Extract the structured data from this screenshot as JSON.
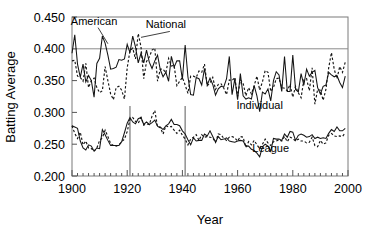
{
  "chart_data": {
    "type": "line",
    "title": "",
    "xlabel": "Year",
    "ylabel": "Batting Average",
    "xlim": [
      1900,
      2000
    ],
    "ylim": [
      0.2,
      0.45
    ],
    "grid": false,
    "legend_position": "inline-annotations",
    "xticks": [
      1900,
      1920,
      1940,
      1960,
      1980,
      2000
    ],
    "xtick_labels": [
      "1900",
      "1920",
      "1940",
      "1960",
      "1980",
      "2000"
    ],
    "yticks": [
      0.2,
      0.25,
      0.3,
      0.35,
      0.4,
      0.45
    ],
    "ytick_labels": [
      "0.200",
      "0.250",
      "0.300",
      "0.350",
      "0.400",
      "0.450"
    ],
    "minor_xtick_interval": 2,
    "annotations": [
      {
        "text": "American",
        "x": 1908,
        "y": 0.438,
        "points_to_x": 1913,
        "points_to_y": 0.408
      },
      {
        "text": "National",
        "x": 1934,
        "y": 0.432,
        "points_to_x": 1925,
        "points_to_y": 0.418
      },
      {
        "text": "Individual",
        "x": 1968,
        "y": 0.306,
        "points_to_x": null,
        "points_to_y": null
      },
      {
        "text": "League",
        "x": 1972,
        "y": 0.238,
        "points_to_x": null,
        "points_to_y": null
      }
    ],
    "reference_lines": [
      {
        "orientation": "horizontal",
        "value": 0.4,
        "label": ".400 mark"
      },
      {
        "orientation": "vertical",
        "value": 1921,
        "label": "live-ball era start"
      },
      {
        "orientation": "vertical",
        "value": 1941,
        "label": "last .400 season"
      }
    ],
    "series": [
      {
        "name": "American League Individual Batting Champion",
        "group": "Individual",
        "style": "solid",
        "x": [
          1900,
          1901,
          1902,
          1903,
          1904,
          1905,
          1906,
          1907,
          1908,
          1909,
          1910,
          1911,
          1912,
          1913,
          1914,
          1915,
          1916,
          1917,
          1918,
          1919,
          1920,
          1921,
          1922,
          1923,
          1924,
          1925,
          1926,
          1927,
          1928,
          1929,
          1930,
          1931,
          1932,
          1933,
          1934,
          1935,
          1936,
          1937,
          1938,
          1939,
          1940,
          1941,
          1942,
          1943,
          1944,
          1945,
          1946,
          1947,
          1948,
          1949,
          1950,
          1951,
          1952,
          1953,
          1954,
          1955,
          1956,
          1957,
          1958,
          1959,
          1960,
          1961,
          1962,
          1963,
          1964,
          1965,
          1966,
          1967,
          1968,
          1969,
          1970,
          1971,
          1972,
          1973,
          1974,
          1975,
          1976,
          1977,
          1978,
          1979,
          1980,
          1981,
          1982,
          1983,
          1984,
          1985,
          1986,
          1987,
          1988,
          1989,
          1990,
          1991,
          1992,
          1993,
          1994,
          1995,
          1996,
          1997,
          1998,
          1999
        ],
        "y": [
          0.393,
          0.422,
          0.376,
          0.355,
          0.376,
          0.348,
          0.358,
          0.35,
          0.324,
          0.377,
          0.385,
          0.42,
          0.409,
          0.39,
          0.368,
          0.369,
          0.371,
          0.383,
          0.382,
          0.384,
          0.407,
          0.394,
          0.42,
          0.403,
          0.378,
          0.393,
          0.378,
          0.398,
          0.379,
          0.369,
          0.381,
          0.39,
          0.367,
          0.356,
          0.363,
          0.349,
          0.388,
          0.371,
          0.381,
          0.381,
          0.352,
          0.406,
          0.356,
          0.328,
          0.327,
          0.355,
          0.353,
          0.343,
          0.369,
          0.343,
          0.354,
          0.344,
          0.327,
          0.337,
          0.341,
          0.34,
          0.353,
          0.388,
          0.328,
          0.353,
          0.32,
          0.361,
          0.326,
          0.321,
          0.323,
          0.321,
          0.342,
          0.326,
          0.301,
          0.332,
          0.329,
          0.337,
          0.318,
          0.35,
          0.364,
          0.359,
          0.333,
          0.388,
          0.333,
          0.333,
          0.39,
          0.336,
          0.332,
          0.361,
          0.343,
          0.368,
          0.357,
          0.363,
          0.366,
          0.339,
          0.329,
          0.341,
          0.343,
          0.363,
          0.359,
          0.356,
          0.358,
          0.347,
          0.339,
          0.357
        ]
      },
      {
        "name": "National League Individual Batting Champion",
        "group": "Individual",
        "style": "dashed",
        "x": [
          1900,
          1901,
          1902,
          1903,
          1904,
          1905,
          1906,
          1907,
          1908,
          1909,
          1910,
          1911,
          1912,
          1913,
          1914,
          1915,
          1916,
          1917,
          1918,
          1919,
          1920,
          1921,
          1922,
          1923,
          1924,
          1925,
          1926,
          1927,
          1928,
          1929,
          1930,
          1931,
          1932,
          1933,
          1934,
          1935,
          1936,
          1937,
          1938,
          1939,
          1940,
          1941,
          1942,
          1943,
          1944,
          1945,
          1946,
          1947,
          1948,
          1949,
          1950,
          1951,
          1952,
          1953,
          1954,
          1955,
          1956,
          1957,
          1958,
          1959,
          1960,
          1961,
          1962,
          1963,
          1964,
          1965,
          1966,
          1967,
          1968,
          1969,
          1970,
          1971,
          1972,
          1973,
          1974,
          1975,
          1976,
          1977,
          1978,
          1979,
          1980,
          1981,
          1982,
          1983,
          1984,
          1985,
          1986,
          1987,
          1988,
          1989,
          1990,
          1991,
          1992,
          1993,
          1994,
          1995,
          1996,
          1997,
          1998,
          1999
        ],
        "y": [
          0.381,
          0.382,
          0.357,
          0.355,
          0.349,
          0.377,
          0.339,
          0.35,
          0.354,
          0.339,
          0.331,
          0.334,
          0.372,
          0.35,
          0.329,
          0.32,
          0.339,
          0.341,
          0.335,
          0.321,
          0.37,
          0.397,
          0.401,
          0.384,
          0.424,
          0.403,
          0.353,
          0.38,
          0.387,
          0.398,
          0.401,
          0.349,
          0.368,
          0.368,
          0.362,
          0.385,
          0.373,
          0.374,
          0.342,
          0.349,
          0.355,
          0.343,
          0.33,
          0.357,
          0.357,
          0.355,
          0.365,
          0.363,
          0.376,
          0.342,
          0.346,
          0.355,
          0.336,
          0.344,
          0.345,
          0.338,
          0.328,
          0.351,
          0.35,
          0.355,
          0.325,
          0.351,
          0.346,
          0.326,
          0.339,
          0.329,
          0.342,
          0.357,
          0.335,
          0.348,
          0.366,
          0.363,
          0.333,
          0.339,
          0.353,
          0.354,
          0.339,
          0.338,
          0.334,
          0.344,
          0.324,
          0.341,
          0.331,
          0.323,
          0.351,
          0.353,
          0.334,
          0.37,
          0.313,
          0.336,
          0.335,
          0.319,
          0.336,
          0.37,
          0.394,
          0.368,
          0.353,
          0.372,
          0.363,
          0.379
        ]
      },
      {
        "name": "American League Average",
        "group": "League",
        "style": "solid",
        "x": [
          1900,
          1901,
          1902,
          1903,
          1904,
          1905,
          1906,
          1907,
          1908,
          1909,
          1910,
          1911,
          1912,
          1913,
          1914,
          1915,
          1916,
          1917,
          1918,
          1919,
          1920,
          1921,
          1922,
          1923,
          1924,
          1925,
          1926,
          1927,
          1928,
          1929,
          1930,
          1931,
          1932,
          1933,
          1934,
          1935,
          1936,
          1937,
          1938,
          1939,
          1940,
          1941,
          1942,
          1943,
          1944,
          1945,
          1946,
          1947,
          1948,
          1949,
          1950,
          1951,
          1952,
          1953,
          1954,
          1955,
          1956,
          1957,
          1958,
          1959,
          1960,
          1961,
          1962,
          1963,
          1964,
          1965,
          1966,
          1967,
          1968,
          1969,
          1970,
          1971,
          1972,
          1973,
          1974,
          1975,
          1976,
          1977,
          1978,
          1979,
          1980,
          1981,
          1982,
          1983,
          1984,
          1985,
          1986,
          1987,
          1988,
          1989,
          1990,
          1991,
          1992,
          1993,
          1994,
          1995,
          1996,
          1997,
          1998,
          1999
        ],
        "y": [
          0.279,
          0.277,
          0.275,
          0.255,
          0.244,
          0.241,
          0.249,
          0.247,
          0.239,
          0.244,
          0.243,
          0.273,
          0.265,
          0.256,
          0.248,
          0.248,
          0.248,
          0.248,
          0.254,
          0.268,
          0.283,
          0.292,
          0.285,
          0.282,
          0.29,
          0.292,
          0.281,
          0.285,
          0.281,
          0.284,
          0.288,
          0.278,
          0.277,
          0.273,
          0.279,
          0.282,
          0.289,
          0.281,
          0.281,
          0.279,
          0.271,
          0.266,
          0.257,
          0.249,
          0.26,
          0.255,
          0.256,
          0.256,
          0.266,
          0.263,
          0.271,
          0.262,
          0.253,
          0.262,
          0.257,
          0.258,
          0.26,
          0.255,
          0.254,
          0.253,
          0.255,
          0.256,
          0.255,
          0.247,
          0.247,
          0.242,
          0.24,
          0.236,
          0.23,
          0.246,
          0.25,
          0.247,
          0.239,
          0.259,
          0.258,
          0.258,
          0.256,
          0.266,
          0.261,
          0.27,
          0.269,
          0.256,
          0.264,
          0.266,
          0.264,
          0.261,
          0.262,
          0.265,
          0.259,
          0.261,
          0.259,
          0.26,
          0.259,
          0.267,
          0.273,
          0.27,
          0.277,
          0.271,
          0.271,
          0.275
        ]
      },
      {
        "name": "National League Average",
        "group": "League",
        "style": "dashed",
        "x": [
          1900,
          1901,
          1902,
          1903,
          1904,
          1905,
          1906,
          1907,
          1908,
          1909,
          1910,
          1911,
          1912,
          1913,
          1914,
          1915,
          1916,
          1917,
          1918,
          1919,
          1920,
          1921,
          1922,
          1923,
          1924,
          1925,
          1926,
          1927,
          1928,
          1929,
          1930,
          1931,
          1932,
          1933,
          1934,
          1935,
          1936,
          1937,
          1938,
          1939,
          1940,
          1941,
          1942,
          1943,
          1944,
          1945,
          1946,
          1947,
          1948,
          1949,
          1950,
          1951,
          1952,
          1953,
          1954,
          1955,
          1956,
          1957,
          1958,
          1959,
          1960,
          1961,
          1962,
          1963,
          1964,
          1965,
          1966,
          1967,
          1968,
          1969,
          1970,
          1971,
          1972,
          1973,
          1974,
          1975,
          1976,
          1977,
          1978,
          1979,
          1980,
          1981,
          1982,
          1983,
          1984,
          1985,
          1986,
          1987,
          1988,
          1989,
          1990,
          1991,
          1992,
          1993,
          1994,
          1995,
          1996,
          1997,
          1998,
          1999
        ],
        "y": [
          0.279,
          0.267,
          0.259,
          0.269,
          0.249,
          0.255,
          0.244,
          0.243,
          0.239,
          0.244,
          0.256,
          0.26,
          0.272,
          0.262,
          0.251,
          0.248,
          0.247,
          0.249,
          0.254,
          0.258,
          0.27,
          0.289,
          0.292,
          0.286,
          0.283,
          0.292,
          0.28,
          0.282,
          0.281,
          0.294,
          0.303,
          0.277,
          0.276,
          0.266,
          0.279,
          0.277,
          0.278,
          0.272,
          0.267,
          0.272,
          0.264,
          0.258,
          0.249,
          0.258,
          0.261,
          0.265,
          0.256,
          0.265,
          0.261,
          0.262,
          0.261,
          0.26,
          0.253,
          0.266,
          0.265,
          0.259,
          0.256,
          0.261,
          0.262,
          0.26,
          0.255,
          0.262,
          0.261,
          0.245,
          0.254,
          0.249,
          0.256,
          0.249,
          0.243,
          0.25,
          0.258,
          0.252,
          0.248,
          0.254,
          0.255,
          0.257,
          0.255,
          0.262,
          0.254,
          0.261,
          0.259,
          0.255,
          0.258,
          0.255,
          0.255,
          0.252,
          0.253,
          0.261,
          0.248,
          0.246,
          0.256,
          0.25,
          0.252,
          0.264,
          0.267,
          0.263,
          0.262,
          0.263,
          0.262,
          0.268
        ]
      }
    ]
  },
  "colors": {
    "ink": "#141414",
    "frame": "#7a7a7a",
    "reference": "#8a8a8a",
    "background": "#ffffff"
  }
}
